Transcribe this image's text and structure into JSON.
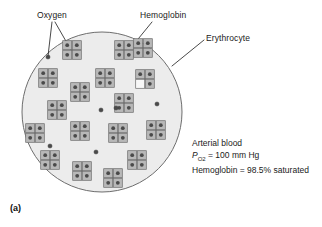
{
  "figure": {
    "panel_letter": "(a)",
    "background_color": "#ffffff",
    "cell": {
      "name": "erythrocyte",
      "fill_color": "#ececec",
      "stroke_color": "#6e6e6e",
      "center_x": 102,
      "center_y": 112,
      "radius": 80
    }
  },
  "labels": {
    "oxygen": "Oxygen",
    "hemoglobin": "Hemoglobin",
    "erythrocyte": "Erythrocyte"
  },
  "stats": {
    "line1": "Arterial blood",
    "po2_symbol": "P",
    "po2_subscript": "O",
    "po2_subscript_number": "2",
    "po2_value": " = 100 mm Hg",
    "saturation_line": "Hemoglobin = 98.5% saturated"
  },
  "legend_semantics": {
    "oxygen_molecule": "small dark filled circle",
    "hemoglobin_molecule": "2 by 2 grid of gray subunit squares",
    "bound_oxygen": "dark circle inside a subunit square",
    "empty_subunit": "white square with no oxygen"
  },
  "colors": {
    "cell_fill": "#ececec",
    "cell_stroke": "#6e6e6e",
    "hemoglobin_fill": "#b8b8b8",
    "hemoglobin_stroke": "#6a6a6a",
    "empty_subunit_fill": "#f7f7f7",
    "oxygen_fill": "#4a4a4a",
    "leader_line": "#1a1a1a",
    "text": "#1a1a1a"
  },
  "chart_data": {
    "type": "scatter",
    "hemoglobin_count": 22,
    "free_oxygen_count": 6,
    "saturation_percent": 98.5,
    "po2_mm_hg": 100,
    "hemoglobin_molecules": [
      {
        "x": 72,
        "y": 50,
        "occupied": [
          1,
          1,
          1,
          1
        ]
      },
      {
        "x": 124,
        "y": 50,
        "occupied": [
          1,
          1,
          1,
          1
        ]
      },
      {
        "x": 48,
        "y": 78,
        "occupied": [
          1,
          1,
          1,
          1
        ]
      },
      {
        "x": 105,
        "y": 78,
        "occupied": [
          1,
          1,
          1,
          1
        ]
      },
      {
        "x": 145,
        "y": 79,
        "occupied": [
          1,
          1,
          0,
          1
        ]
      },
      {
        "x": 80,
        "y": 92,
        "occupied": [
          1,
          1,
          1,
          1
        ]
      },
      {
        "x": 57,
        "y": 110,
        "occupied": [
          1,
          1,
          1,
          1
        ]
      },
      {
        "x": 124,
        "y": 103,
        "occupied": [
          1,
          1,
          1,
          1
        ]
      },
      {
        "x": 35,
        "y": 133,
        "occupied": [
          1,
          1,
          1,
          1
        ]
      },
      {
        "x": 80,
        "y": 131,
        "occupied": [
          1,
          1,
          1,
          1
        ]
      },
      {
        "x": 118,
        "y": 133,
        "occupied": [
          1,
          1,
          1,
          1
        ]
      },
      {
        "x": 156,
        "y": 130,
        "occupied": [
          1,
          1,
          1,
          1
        ]
      },
      {
        "x": 50,
        "y": 160,
        "occupied": [
          1,
          1,
          1,
          1
        ]
      },
      {
        "x": 82,
        "y": 171,
        "occupied": [
          1,
          1,
          1,
          1
        ]
      },
      {
        "x": 113,
        "y": 178,
        "occupied": [
          1,
          1,
          1,
          1
        ]
      },
      {
        "x": 137,
        "y": 160,
        "occupied": [
          1,
          1,
          1,
          1
        ]
      },
      {
        "x": 143,
        "y": 48,
        "occupied": [
          1,
          1,
          1,
          1
        ]
      }
    ],
    "free_oxygen": [
      {
        "x": 48,
        "y": 57
      },
      {
        "x": 101,
        "y": 110
      },
      {
        "x": 157,
        "y": 104
      },
      {
        "x": 50,
        "y": 146
      },
      {
        "x": 96,
        "y": 152
      },
      {
        "x": 116,
        "y": 108
      }
    ]
  }
}
